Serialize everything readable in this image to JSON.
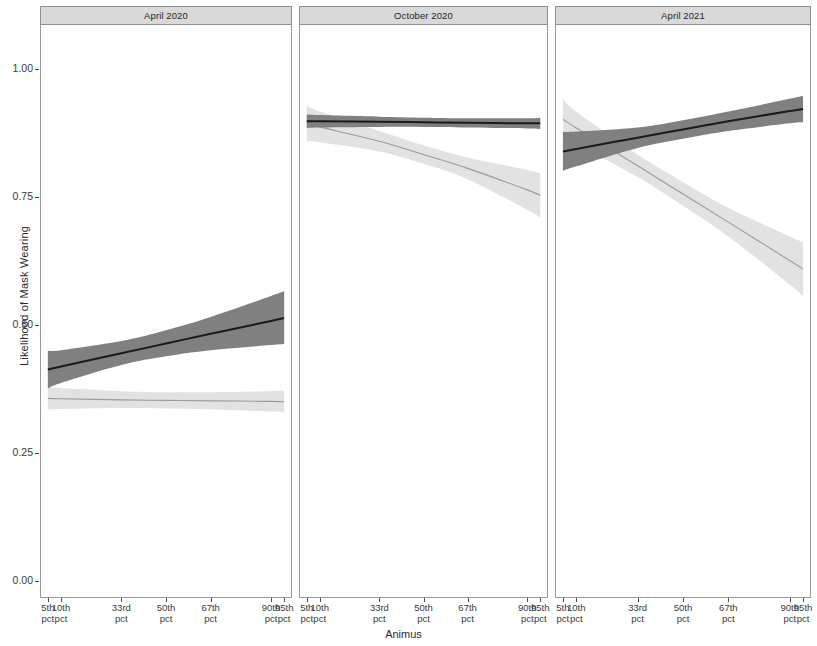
{
  "chart_data": {
    "type": "line",
    "title": "",
    "xlabel": "Animus",
    "ylabel": "Likelihood of Mask Wearing",
    "ylim": [
      0.0,
      1.0
    ],
    "y_ticks": [
      "0.00",
      "0.25",
      "0.50",
      "0.75",
      "1.00"
    ],
    "y_tick_values": [
      0.0,
      0.25,
      0.5,
      0.75,
      1.0
    ],
    "x_ticks": [
      {
        "line1": "5th",
        "line2": "pct",
        "pos": 0.05
      },
      {
        "line1": "10th",
        "line2": "pct",
        "pos": 0.1
      },
      {
        "line1": "33rd",
        "line2": "pct",
        "pos": 0.33
      },
      {
        "line1": "50th",
        "line2": "pct",
        "pos": 0.5
      },
      {
        "line1": "67th",
        "line2": "pct",
        "pos": 0.67
      },
      {
        "line1": "90th",
        "line2": "pct",
        "pos": 0.9
      },
      {
        "line1": "95th",
        "line2": "pct",
        "pos": 0.95
      }
    ],
    "grid": false,
    "legend": "none",
    "colors": {
      "dark_line": "#1a1a1a",
      "dark_band": "#808080",
      "light_line": "#9a9a9a",
      "light_band": "#e2e2e2",
      "strip_background": "#d9d9d9",
      "panel_border": "#9a9a9a",
      "text": "#2b2b2b"
    },
    "facets": [
      {
        "label": "April 2020",
        "series": [
          {
            "name": "dark",
            "x": [
              0.05,
              0.1,
              0.33,
              0.5,
              0.67,
              0.9,
              0.95
            ],
            "values": [
              0.412,
              0.418,
              0.444,
              0.463,
              0.482,
              0.507,
              0.513
            ],
            "ci_lower": [
              0.375,
              0.386,
              0.421,
              0.438,
              0.45,
              0.46,
              0.462
            ],
            "ci_upper": [
              0.449,
              0.45,
              0.468,
              0.489,
              0.515,
              0.556,
              0.565
            ]
          },
          {
            "name": "light",
            "x": [
              0.05,
              0.1,
              0.33,
              0.5,
              0.67,
              0.9,
              0.95
            ],
            "values": [
              0.356,
              0.355,
              0.353,
              0.352,
              0.351,
              0.35,
              0.349
            ],
            "ci_lower": [
              0.334,
              0.335,
              0.337,
              0.336,
              0.334,
              0.33,
              0.328
            ],
            "ci_upper": [
              0.378,
              0.376,
              0.37,
              0.368,
              0.368,
              0.37,
              0.371
            ]
          }
        ]
      },
      {
        "label": "October 2020",
        "series": [
          {
            "name": "dark",
            "x": [
              0.05,
              0.1,
              0.33,
              0.5,
              0.67,
              0.9,
              0.95
            ],
            "values": [
              0.897,
              0.897,
              0.896,
              0.895,
              0.894,
              0.893,
              0.893
            ],
            "ci_lower": [
              0.884,
              0.885,
              0.886,
              0.886,
              0.885,
              0.883,
              0.882
            ],
            "ci_upper": [
              0.91,
              0.909,
              0.906,
              0.904,
              0.903,
              0.903,
              0.904
            ]
          },
          {
            "name": "light",
            "x": [
              0.05,
              0.1,
              0.33,
              0.5,
              0.67,
              0.9,
              0.95
            ],
            "values": [
              0.893,
              0.886,
              0.858,
              0.832,
              0.805,
              0.763,
              0.752
            ],
            "ci_lower": [
              0.858,
              0.856,
              0.838,
              0.814,
              0.784,
              0.724,
              0.708
            ],
            "ci_upper": [
              0.928,
              0.916,
              0.878,
              0.85,
              0.826,
              0.802,
              0.796
            ]
          }
        ]
      },
      {
        "label": "April 2021",
        "series": [
          {
            "name": "dark",
            "x": [
              0.05,
              0.1,
              0.33,
              0.5,
              0.67,
              0.9,
              0.95
            ],
            "values": [
              0.838,
              0.843,
              0.865,
              0.881,
              0.897,
              0.917,
              0.921
            ],
            "ci_lower": [
              0.8,
              0.809,
              0.845,
              0.863,
              0.878,
              0.893,
              0.895
            ],
            "ci_upper": [
              0.876,
              0.877,
              0.885,
              0.899,
              0.916,
              0.941,
              0.947
            ]
          },
          {
            "name": "light",
            "x": [
              0.05,
              0.1,
              0.33,
              0.5,
              0.67,
              0.9,
              0.95
            ],
            "values": [
              0.901,
              0.884,
              0.81,
              0.755,
              0.7,
              0.625,
              0.608
            ],
            "ci_lower": [
              0.861,
              0.852,
              0.788,
              0.732,
              0.672,
              0.578,
              0.555
            ],
            "ci_upper": [
              0.941,
              0.916,
              0.832,
              0.778,
              0.728,
              0.672,
              0.661
            ]
          }
        ]
      }
    ]
  }
}
